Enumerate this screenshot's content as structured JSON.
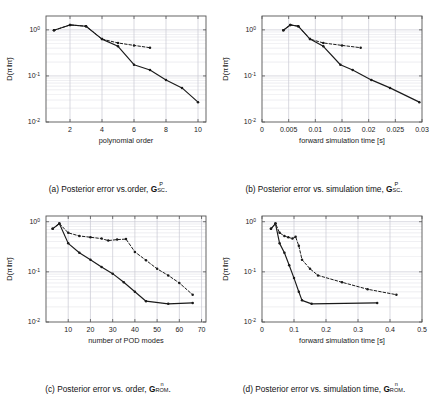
{
  "figure": {
    "panel_count": 4,
    "ylabel": "D(π‖π̃)",
    "series_names": [
      "solid-curve",
      "dashed-curve"
    ],
    "colors": {
      "line": "#1a1a1a",
      "grid": "#c8c8d2",
      "axis": "#555555",
      "background": "#ffffff"
    }
  },
  "panels": [
    {
      "id": "a",
      "caption_prefix": "(a) Posterior error vs.order,",
      "caption_symbol": "G",
      "caption_sup": "P",
      "caption_sub": "SC",
      "caption_suffix": ".",
      "xlabel": "polynomial order",
      "ylabel": "D(π‖π̃)",
      "xticks": [
        2,
        4,
        6,
        8,
        10
      ],
      "xtick_labels": [
        "2",
        "4",
        "6",
        "8",
        "10"
      ],
      "xlim": [
        0.5,
        10.5
      ],
      "ylim": [
        0.01,
        2.0
      ],
      "yticks": [
        1,
        0.1,
        0.01
      ],
      "ytick_labels": [
        "10^0",
        "10^-1",
        "10^-2"
      ]
    },
    {
      "id": "b",
      "caption_prefix": "(b) Posterior error vs. simulation time,",
      "caption_symbol": "G",
      "caption_sup": "P",
      "caption_sub": "SC",
      "caption_suffix": ".",
      "xlabel": "forward simulation time [s]",
      "ylabel": "D(π‖π̃)",
      "xticks": [
        0,
        0.005,
        0.01,
        0.015,
        0.02,
        0.025,
        0.03
      ],
      "xtick_labels": [
        "0",
        "0.005",
        "0.01",
        "0.015",
        "0.02",
        "0.025",
        "0.03"
      ],
      "xlim": [
        0,
        0.03
      ],
      "ylim": [
        0.01,
        2.0
      ],
      "yticks": [
        1,
        0.1,
        0.01
      ],
      "ytick_labels": [
        "10^0",
        "10^-1",
        "10^-2"
      ]
    },
    {
      "id": "c",
      "caption_prefix": "(c) Posterior error vs. order,",
      "caption_symbol": "G",
      "caption_sup": "n",
      "caption_sub": "ROM",
      "caption_suffix": ".",
      "xlabel": "number of POD modes",
      "ylabel": "D(π‖π̃)",
      "xticks": [
        10,
        20,
        30,
        40,
        50,
        60,
        70
      ],
      "xtick_labels": [
        "10",
        "20",
        "30",
        "40",
        "50",
        "60",
        "70"
      ],
      "xlim": [
        0,
        72
      ],
      "ylim": [
        0.01,
        1.3
      ],
      "yticks": [
        1,
        0.1,
        0.01
      ],
      "ytick_labels": [
        "10^0",
        "10^-1",
        "10^-2"
      ]
    },
    {
      "id": "d",
      "caption_prefix": "(d) Posterior error vs. simulation time,",
      "caption_symbol": "G",
      "caption_sup": "n",
      "caption_sub": "ROM",
      "caption_suffix": ".",
      "xlabel": "forward simulation time [s]",
      "ylabel": "D(π‖π̃)",
      "xticks": [
        0,
        0.1,
        0.2,
        0.3,
        0.4,
        0.5
      ],
      "xtick_labels": [
        "0",
        "0.1",
        "0.2",
        "0.3",
        "0.4",
        "0.5"
      ],
      "xlim": [
        0,
        0.5
      ],
      "ylim": [
        0.01,
        1.3
      ],
      "yticks": [
        1,
        0.1,
        0.01
      ],
      "ytick_labels": [
        "10^0",
        "10^-1",
        "10^-2"
      ]
    }
  ],
  "chart_data": [
    {
      "type": "line",
      "panel": "a",
      "title": "(a) Posterior error vs. order, G_SC^P",
      "xlabel": "polynomial order",
      "ylabel": "D(π‖π̃)",
      "yscale": "log",
      "xlim": [
        0.5,
        10.5
      ],
      "ylim": [
        0.01,
        2.0
      ],
      "grid": true,
      "legend": "none",
      "series": [
        {
          "name": "solid-curve",
          "style": "solid",
          "marker": "dot",
          "x": [
            1,
            2,
            3,
            4,
            5,
            6,
            7,
            8,
            9,
            10
          ],
          "y": [
            0.98,
            1.28,
            1.2,
            0.63,
            0.44,
            0.175,
            0.135,
            0.082,
            0.055,
            0.027
          ]
        },
        {
          "name": "dashed-curve",
          "style": "dashed",
          "marker": "dot",
          "x": [
            1,
            2,
            3,
            4,
            5,
            6,
            7
          ],
          "y": [
            0.98,
            1.28,
            1.2,
            0.63,
            0.52,
            0.46,
            0.41
          ]
        }
      ]
    },
    {
      "type": "line",
      "panel": "b",
      "title": "(b) Posterior error vs. simulation time, G_SC^P",
      "xlabel": "forward simulation time [s]",
      "ylabel": "D(π‖π̃)",
      "yscale": "log",
      "xlim": [
        0,
        0.03
      ],
      "ylim": [
        0.01,
        2.0
      ],
      "grid": true,
      "legend": "none",
      "series": [
        {
          "name": "solid-curve",
          "style": "solid",
          "marker": "dot",
          "x": [
            0.004,
            0.0053,
            0.0068,
            0.009,
            0.0115,
            0.0147,
            0.017,
            0.0205,
            0.024,
            0.0295
          ],
          "y": [
            0.98,
            1.28,
            1.2,
            0.63,
            0.44,
            0.175,
            0.135,
            0.082,
            0.055,
            0.027
          ]
        },
        {
          "name": "dashed-curve",
          "style": "dashed",
          "marker": "dot",
          "x": [
            0.004,
            0.0053,
            0.0068,
            0.009,
            0.0115,
            0.015,
            0.0185
          ],
          "y": [
            0.98,
            1.28,
            1.2,
            0.63,
            0.52,
            0.46,
            0.41
          ]
        }
      ]
    },
    {
      "type": "line",
      "panel": "c",
      "title": "(c) Posterior error vs. order, G_ROM^n",
      "xlabel": "number of POD modes",
      "ylabel": "D(π‖π̃)",
      "yscale": "log",
      "xlim": [
        0,
        72
      ],
      "ylim": [
        0.01,
        1.3
      ],
      "grid": true,
      "legend": "none",
      "series": [
        {
          "name": "solid-curve",
          "style": "solid",
          "marker": "dot",
          "x": [
            3,
            6,
            10,
            15,
            20,
            25,
            30,
            35,
            40,
            45,
            55,
            66
          ],
          "y": [
            0.72,
            0.92,
            0.37,
            0.24,
            0.175,
            0.125,
            0.092,
            0.062,
            0.04,
            0.026,
            0.023,
            0.024
          ]
        },
        {
          "name": "dashed-curve",
          "style": "dashed",
          "marker": "dot",
          "x": [
            3,
            6,
            10,
            15,
            20,
            25,
            28,
            32,
            36,
            40,
            45,
            50,
            55,
            60,
            66
          ],
          "y": [
            0.72,
            0.92,
            0.6,
            0.52,
            0.49,
            0.46,
            0.42,
            0.44,
            0.45,
            0.25,
            0.17,
            0.115,
            0.085,
            0.06,
            0.035
          ]
        }
      ]
    },
    {
      "type": "line",
      "panel": "d",
      "title": "(d) Posterior error vs. simulation time, G_ROM^n",
      "xlabel": "forward simulation time [s]",
      "ylabel": "D(π‖π̃)",
      "yscale": "log",
      "xlim": [
        0,
        0.5
      ],
      "ylim": [
        0.01,
        1.3
      ],
      "grid": true,
      "legend": "none",
      "series": [
        {
          "name": "solid-curve",
          "style": "solid",
          "marker": "dot",
          "x": [
            0.028,
            0.042,
            0.055,
            0.07,
            0.085,
            0.1,
            0.115,
            0.125,
            0.155,
            0.36
          ],
          "y": [
            0.72,
            0.92,
            0.37,
            0.24,
            0.135,
            0.075,
            0.04,
            0.027,
            0.023,
            0.024
          ]
        },
        {
          "name": "dashed-curve",
          "style": "dashed",
          "marker": "dot",
          "x": [
            0.028,
            0.042,
            0.055,
            0.07,
            0.082,
            0.095,
            0.105,
            0.115,
            0.125,
            0.15,
            0.175,
            0.25,
            0.33,
            0.42
          ],
          "y": [
            0.72,
            0.92,
            0.6,
            0.52,
            0.49,
            0.46,
            0.5,
            0.33,
            0.175,
            0.115,
            0.085,
            0.062,
            0.045,
            0.035
          ]
        }
      ]
    }
  ]
}
